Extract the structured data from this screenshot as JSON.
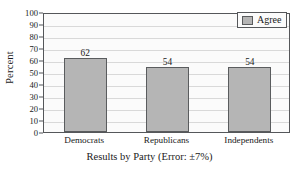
{
  "chart_data": {
    "type": "bar",
    "title": "",
    "categories": [
      "Democrats",
      "Republicans",
      "Independents"
    ],
    "values": [
      62,
      54,
      54
    ],
    "series": [
      {
        "name": "Agree",
        "values": [
          62,
          54,
          54
        ]
      }
    ],
    "xlabel": "Results by Party (Error: ±7%)",
    "ylabel": "Percent",
    "ylim": [
      0,
      100
    ],
    "ytick_values": [
      100,
      90,
      80,
      70,
      60,
      50,
      40,
      30,
      20,
      10,
      0
    ],
    "ytick_labels": [
      "100",
      "90",
      "80",
      "70",
      "60",
      "50",
      "40",
      "30",
      "20",
      "10",
      "0"
    ],
    "value_labels": [
      "62",
      "54",
      "54"
    ],
    "grid": true,
    "grid_axis": "y",
    "legend": {
      "position": "top-right-inside",
      "entries": [
        {
          "label": "Agree",
          "color": "#b5b5b5"
        }
      ]
    },
    "colors": {
      "bar_fill": "#b5b5b5",
      "bar_edge": "#5a5c5e",
      "plot_background": "#fbfbfb",
      "gridline": "#d9d9d9",
      "axis": "#55575a",
      "text": "#1a1a1a"
    }
  }
}
